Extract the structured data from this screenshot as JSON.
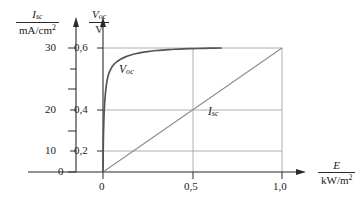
{
  "figure": {
    "background": "#ffffff",
    "ink_color": "#2b2b2b",
    "grid_color": "#9a9a9a",
    "curve_color": "#555555",
    "line_color": "#8d8d8d"
  },
  "axes": {
    "left": {
      "quantity": "I",
      "quantity_sub": "sc",
      "unit": "mA/cm",
      "unit_sup": "2",
      "ticks": [
        "0",
        "10",
        "20",
        "30"
      ],
      "tick_values": [
        0,
        10,
        20,
        30
      ],
      "minor_tick_values": [
        5,
        15,
        25
      ],
      "range": [
        0,
        33
      ]
    },
    "right_inner": {
      "quantity": "V",
      "quantity_sub": "oc",
      "unit": "V",
      "ticks": [
        "0,2",
        "0,4",
        "0,6"
      ],
      "tick_values": [
        0.2,
        0.4,
        0.6
      ],
      "range": [
        0,
        0.66
      ]
    },
    "bottom": {
      "quantity": "E",
      "unit": "kW/m",
      "unit_sup": "2",
      "ticks": [
        "0",
        "0,5",
        "1,0"
      ],
      "tick_values": [
        0,
        0.5,
        1.0
      ],
      "range": [
        0,
        1.12
      ]
    }
  },
  "chart_data": {
    "type": "line",
    "title": "",
    "subtitle": "",
    "xlabel": "E / kW/m2",
    "ylabel": "I_sc / mA/cm2 ; V_oc / V",
    "xlim": [
      0,
      1.12
    ],
    "ylim": [
      0,
      0.66
    ],
    "grid": true,
    "legend_position": "inline-annotation",
    "annotations": [
      {
        "text": "V",
        "sub": "oc",
        "x": 0.16,
        "y": 0.515
      },
      {
        "text": "I",
        "sub": "sc",
        "x": 0.6,
        "y": 0.3
      }
    ],
    "series": [
      {
        "name": "V_oc",
        "label": "V oc",
        "axis": "right_inner",
        "units": "V",
        "color": "#555555",
        "x": [
          0,
          0.002,
          0.005,
          0.008,
          0.012,
          0.018,
          0.025,
          0.032,
          0.04,
          0.05,
          0.065,
          0.08,
          0.1,
          0.125,
          0.15,
          0.18,
          0.22,
          0.26,
          0.3,
          0.35,
          0.4,
          0.45,
          0.5,
          0.55,
          0.6,
          0.66
        ],
        "y": [
          0,
          0.155,
          0.255,
          0.315,
          0.365,
          0.415,
          0.452,
          0.475,
          0.492,
          0.508,
          0.524,
          0.535,
          0.547,
          0.557,
          0.565,
          0.572,
          0.579,
          0.584,
          0.588,
          0.591,
          0.594,
          0.596,
          0.597,
          0.598,
          0.599,
          0.6
        ]
      },
      {
        "name": "I_sc",
        "label": "I sc",
        "axis": "left",
        "units": "mA/cm2",
        "color": "#8d8d8d",
        "x": [
          0,
          1.0
        ],
        "y": [
          0,
          30
        ]
      }
    ]
  }
}
